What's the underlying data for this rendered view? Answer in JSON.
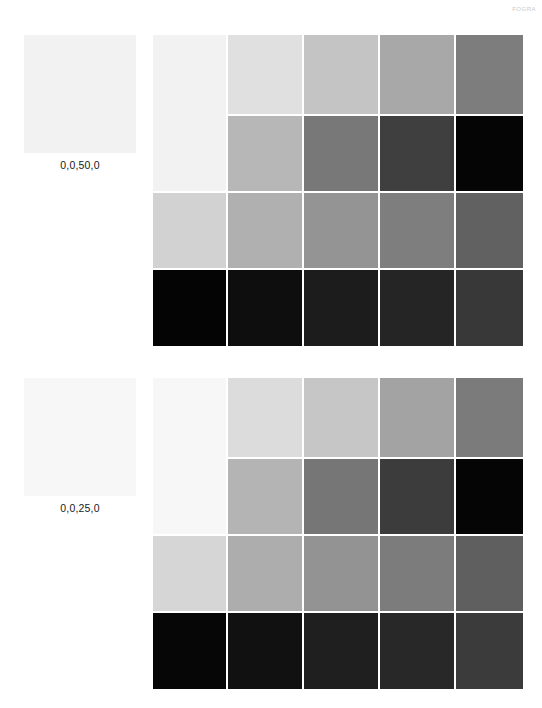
{
  "header": {
    "code": "FOGRA"
  },
  "groups": [
    {
      "id": "group-1",
      "label": "0,0,50,0",
      "reference_color": "#f2f2f2",
      "grid": {
        "columns": 5,
        "rows": 4,
        "merged_first_column_rows": [
          1,
          2
        ],
        "cells": [
          {
            "row": 1,
            "col": 1,
            "color": "#f2f2f2",
            "rowspan": 2
          },
          {
            "row": 1,
            "col": 2,
            "color": "#e0e0e0"
          },
          {
            "row": 1,
            "col": 3,
            "color": "#c4c4c4"
          },
          {
            "row": 1,
            "col": 4,
            "color": "#a8a8a8"
          },
          {
            "row": 1,
            "col": 5,
            "color": "#7d7d7d"
          },
          {
            "row": 2,
            "col": 2,
            "color": "#b7b7b7"
          },
          {
            "row": 2,
            "col": 3,
            "color": "#787878"
          },
          {
            "row": 2,
            "col": 4,
            "color": "#3f3f3f"
          },
          {
            "row": 2,
            "col": 5,
            "color": "#050505"
          },
          {
            "row": 3,
            "col": 1,
            "color": "#d2d2d2"
          },
          {
            "row": 3,
            "col": 2,
            "color": "#b0b0b0"
          },
          {
            "row": 3,
            "col": 3,
            "color": "#949494"
          },
          {
            "row": 3,
            "col": 4,
            "color": "#7e7e7e"
          },
          {
            "row": 3,
            "col": 5,
            "color": "#616161"
          },
          {
            "row": 4,
            "col": 1,
            "color": "#040404"
          },
          {
            "row": 4,
            "col": 2,
            "color": "#0e0e0e"
          },
          {
            "row": 4,
            "col": 3,
            "color": "#1c1c1c"
          },
          {
            "row": 4,
            "col": 4,
            "color": "#252525"
          },
          {
            "row": 4,
            "col": 5,
            "color": "#383838"
          }
        ]
      }
    },
    {
      "id": "group-2",
      "label": "0,0,25,0",
      "reference_color": "#f7f7f7",
      "grid": {
        "columns": 5,
        "rows": 4,
        "merged_first_column_rows": [
          1,
          2
        ],
        "cells": [
          {
            "row": 1,
            "col": 1,
            "color": "#f7f7f7",
            "rowspan": 2
          },
          {
            "row": 1,
            "col": 2,
            "color": "#dcdcdc"
          },
          {
            "row": 1,
            "col": 3,
            "color": "#c6c6c6"
          },
          {
            "row": 1,
            "col": 4,
            "color": "#a3a3a3"
          },
          {
            "row": 1,
            "col": 5,
            "color": "#7b7b7b"
          },
          {
            "row": 2,
            "col": 2,
            "color": "#b4b4b4"
          },
          {
            "row": 2,
            "col": 3,
            "color": "#767676"
          },
          {
            "row": 2,
            "col": 4,
            "color": "#3c3c3c"
          },
          {
            "row": 2,
            "col": 5,
            "color": "#050505"
          },
          {
            "row": 3,
            "col": 1,
            "color": "#d6d6d6"
          },
          {
            "row": 3,
            "col": 2,
            "color": "#adadad"
          },
          {
            "row": 3,
            "col": 3,
            "color": "#939393"
          },
          {
            "row": 3,
            "col": 4,
            "color": "#7c7c7c"
          },
          {
            "row": 3,
            "col": 5,
            "color": "#5f5f5f"
          },
          {
            "row": 4,
            "col": 1,
            "color": "#060606"
          },
          {
            "row": 4,
            "col": 2,
            "color": "#111111"
          },
          {
            "row": 4,
            "col": 3,
            "color": "#1f1f1f"
          },
          {
            "row": 4,
            "col": 4,
            "color": "#282828"
          },
          {
            "row": 4,
            "col": 5,
            "color": "#3b3b3b"
          }
        ]
      }
    }
  ]
}
